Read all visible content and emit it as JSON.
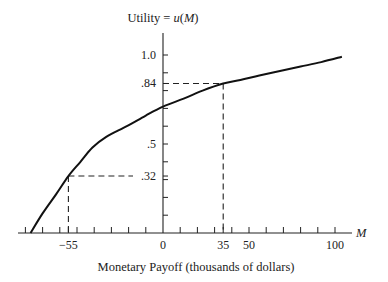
{
  "chart_data": {
    "type": "line",
    "title": "",
    "ylabel": "Utility = u(M)",
    "ylabel_parts": {
      "prefix": "Utility = ",
      "func": "u",
      "open": "(",
      "var": "M",
      "close": ")"
    },
    "xlabel": "Monetary Payoff (thousands of dollars)",
    "x_axis_var": "M",
    "xlim": [
      -80,
      110
    ],
    "ylim": [
      0,
      1.0
    ],
    "x_ticks_minor_step": 10,
    "y_ticks_minor_step": 0.1,
    "x_tick_labels": [
      {
        "value": -55,
        "label": "−55"
      },
      {
        "value": 0,
        "label": "0"
      },
      {
        "value": 35,
        "label": "35"
      },
      {
        "value": 50,
        "label": "50"
      },
      {
        "value": 100,
        "label": "100"
      }
    ],
    "y_tick_labels": [
      {
        "value": 1.0,
        "label": "1.0"
      },
      {
        "value": 0.84,
        "label": ".84"
      },
      {
        "value": 0.5,
        "label": ".5"
      },
      {
        "value": 0.32,
        "label": ".32"
      }
    ],
    "series": [
      {
        "name": "u(M)",
        "x": [
          -77,
          -70,
          -62,
          -55,
          -48,
          -41,
          -33,
          -21,
          -10,
          0,
          12,
          23,
          35,
          45,
          56,
          68,
          80,
          92,
          104
        ],
        "y": [
          0.0,
          0.11,
          0.22,
          0.32,
          0.4,
          0.48,
          0.54,
          0.6,
          0.66,
          0.71,
          0.755,
          0.8,
          0.84,
          0.86,
          0.885,
          0.91,
          0.935,
          0.96,
          0.99
        ]
      }
    ],
    "reference_points": [
      {
        "x": -55,
        "y": 0.32
      },
      {
        "x": 35,
        "y": 0.84
      }
    ],
    "grid": false,
    "legend": "none"
  }
}
